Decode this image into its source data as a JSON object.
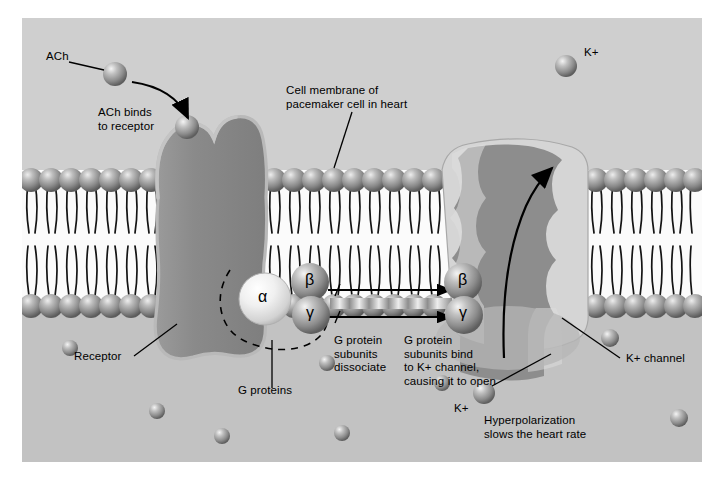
{
  "figure": {
    "title_alt": "Acetylcholine signaling through G protein coupled receptor opening K+ channel in cardiac pacemaker cell",
    "background_color": "#c9c9c9",
    "border_color": "#ffffff"
  },
  "labels": {
    "ach": "ACh",
    "ach_binds": "ACh binds\nto receptor",
    "cell_membrane": "Cell membrane of\npacemaker cell in heart",
    "receptor": "Receptor",
    "g_proteins": "G proteins",
    "dissociate": "G protein\nsubunits\ndissociate",
    "bind_channel": "G protein\nsubunits bind\nto K+ channel,\ncausing it to open",
    "k_channel": "K+ channel",
    "k_plus_top": "K+",
    "k_plus_bottom": "K+",
    "hyperpolarization": "Hyperpolarization\nslows the heart rate"
  },
  "subunits": {
    "alpha": "α",
    "beta_left": "β",
    "gamma_left": "γ",
    "beta_right": "β",
    "gamma_right": "γ"
  },
  "colors": {
    "background": "#c9c9c9",
    "extracellular": "#cfcfcf",
    "cytoplasm": "#c2c2c2",
    "membrane_core": "#fbfbfb",
    "lipid_head": "#8e8e8e",
    "lipid_tail": "#1a1a1a",
    "receptor_fill": "#8a8a8a",
    "receptor_rim": "#b5b5b5",
    "channel_light": "#d5d5d5",
    "channel_dark": "#8d8d8d",
    "channel_mid": "#b0b0b0",
    "sphere_mid": "#9a9a9a",
    "sphere_pale": "#efefef",
    "arrow": "#000000"
  },
  "counts": {
    "lipid_heads_upper": 34,
    "lipid_heads_lower": 34,
    "cytoplasm_ions": 9
  },
  "cytoplasm_ions": [
    {
      "x": 48,
      "y": 330,
      "r": 8
    },
    {
      "x": 135,
      "y": 393,
      "r": 8
    },
    {
      "x": 200,
      "y": 418,
      "r": 8
    },
    {
      "x": 305,
      "y": 345,
      "r": 8
    },
    {
      "x": 320,
      "y": 415,
      "r": 8
    },
    {
      "x": 420,
      "y": 365,
      "r": 8
    },
    {
      "x": 487,
      "y": 350,
      "r": 9
    },
    {
      "x": 588,
      "y": 320,
      "r": 9
    },
    {
      "x": 657,
      "y": 400,
      "r": 9
    }
  ]
}
